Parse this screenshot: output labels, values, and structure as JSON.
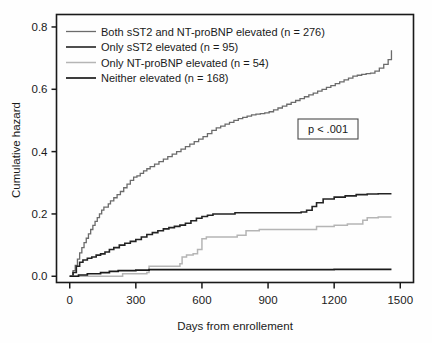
{
  "chart_data": {
    "type": "line",
    "title": "",
    "xlabel": "Days from enrollement",
    "ylabel": "Cumulative hazard",
    "xlim": [
      -60,
      1560
    ],
    "ylim": [
      -0.02,
      0.84
    ],
    "xticks": [
      0,
      300,
      600,
      900,
      1200,
      1500
    ],
    "xtick_labels": [
      "0",
      "300",
      "600",
      "900",
      "1200",
      "1500"
    ],
    "yticks": [
      0.0,
      0.2,
      0.4,
      0.6,
      0.8
    ],
    "ytick_labels": [
      "0.0",
      "0.2",
      "0.4",
      "0.6",
      "0.8"
    ],
    "grid": false,
    "legend_position": "upper-left",
    "annotations": [
      {
        "name": "p-value-box",
        "text": "p < .001",
        "x": 1060,
        "y": 0.44
      }
    ],
    "series": [
      {
        "name": "Both sST2 and NT-proBNP elevated (n = 276)",
        "n": 276,
        "color": "#6b6b6b",
        "width": 1.3,
        "x": [
          0,
          15,
          25,
          35,
          45,
          55,
          65,
          75,
          85,
          95,
          105,
          115,
          125,
          135,
          145,
          155,
          165,
          175,
          185,
          200,
          215,
          230,
          245,
          260,
          275,
          290,
          305,
          320,
          335,
          350,
          365,
          385,
          405,
          425,
          445,
          465,
          485,
          505,
          525,
          545,
          565,
          585,
          605,
          625,
          645,
          665,
          685,
          705,
          725,
          745,
          765,
          785,
          805,
          825,
          845,
          865,
          885,
          905,
          925,
          945,
          965,
          985,
          1005,
          1025,
          1045,
          1065,
          1085,
          1105,
          1125,
          1145,
          1165,
          1185,
          1205,
          1225,
          1245,
          1265,
          1285,
          1305,
          1325,
          1345,
          1365,
          1385,
          1405,
          1425,
          1445,
          1460
        ],
        "y": [
          0.0,
          0.018,
          0.035,
          0.055,
          0.075,
          0.092,
          0.108,
          0.122,
          0.136,
          0.15,
          0.163,
          0.176,
          0.188,
          0.2,
          0.212,
          0.222,
          0.222,
          0.232,
          0.242,
          0.252,
          0.262,
          0.272,
          0.284,
          0.296,
          0.308,
          0.318,
          0.322,
          0.33,
          0.338,
          0.345,
          0.352,
          0.36,
          0.368,
          0.376,
          0.384,
          0.392,
          0.4,
          0.408,
          0.416,
          0.424,
          0.432,
          0.44,
          0.448,
          0.458,
          0.468,
          0.476,
          0.482,
          0.488,
          0.494,
          0.5,
          0.506,
          0.51,
          0.514,
          0.518,
          0.52,
          0.522,
          0.524,
          0.528,
          0.534,
          0.54,
          0.546,
          0.552,
          0.558,
          0.564,
          0.57,
          0.576,
          0.582,
          0.588,
          0.594,
          0.6,
          0.606,
          0.612,
          0.618,
          0.624,
          0.63,
          0.636,
          0.642,
          0.645,
          0.648,
          0.65,
          0.652,
          0.658,
          0.668,
          0.68,
          0.695,
          0.725
        ]
      },
      {
        "name": "Only sST2 elevated (n = 95)",
        "n": 95,
        "color": "#232323",
        "width": 1.6,
        "x": [
          0,
          15,
          30,
          45,
          60,
          80,
          100,
          120,
          140,
          160,
          180,
          200,
          225,
          250,
          275,
          300,
          325,
          350,
          375,
          400,
          425,
          450,
          475,
          500,
          525,
          550,
          575,
          600,
          625,
          650,
          700,
          750,
          800,
          850,
          900,
          950,
          1000,
          1050,
          1075,
          1100,
          1120,
          1150,
          1200,
          1250,
          1300,
          1350,
          1400,
          1450,
          1460
        ],
        "y": [
          0.0,
          0.012,
          0.032,
          0.045,
          0.052,
          0.058,
          0.062,
          0.068,
          0.072,
          0.078,
          0.086,
          0.092,
          0.1,
          0.106,
          0.112,
          0.118,
          0.126,
          0.134,
          0.14,
          0.146,
          0.152,
          0.156,
          0.16,
          0.164,
          0.17,
          0.178,
          0.186,
          0.192,
          0.196,
          0.2,
          0.2,
          0.204,
          0.204,
          0.204,
          0.204,
          0.204,
          0.204,
          0.206,
          0.212,
          0.224,
          0.236,
          0.248,
          0.254,
          0.258,
          0.262,
          0.264,
          0.265,
          0.265,
          0.265
        ]
      },
      {
        "name": "Only NT-proBNP elevated (n = 54)",
        "n": 54,
        "color": "#b5b5b5",
        "width": 1.5,
        "x": [
          0,
          100,
          200,
          240,
          300,
          350,
          360,
          380,
          480,
          500,
          510,
          530,
          560,
          580,
          600,
          620,
          700,
          760,
          800,
          860,
          900,
          1000,
          1080,
          1120,
          1200,
          1260,
          1300,
          1330,
          1350,
          1400,
          1450,
          1460
        ],
        "y": [
          0.0,
          0.0,
          0.0,
          0.008,
          0.008,
          0.012,
          0.032,
          0.032,
          0.032,
          0.04,
          0.062,
          0.068,
          0.072,
          0.086,
          0.12,
          0.126,
          0.126,
          0.132,
          0.146,
          0.15,
          0.15,
          0.15,
          0.15,
          0.16,
          0.164,
          0.168,
          0.168,
          0.18,
          0.188,
          0.19,
          0.19,
          0.19
        ]
      },
      {
        "name": "Neither elevated (n = 168)",
        "n": 168,
        "color": "#1a1a1a",
        "width": 1.7,
        "x": [
          0,
          40,
          80,
          140,
          180,
          220,
          260,
          300,
          340,
          360,
          420,
          500,
          600,
          700,
          800,
          900,
          1000,
          1100,
          1200,
          1300,
          1400,
          1450,
          1460
        ],
        "y": [
          0.0,
          0.004,
          0.008,
          0.012,
          0.016,
          0.018,
          0.018,
          0.02,
          0.02,
          0.021,
          0.021,
          0.021,
          0.021,
          0.021,
          0.021,
          0.021,
          0.021,
          0.021,
          0.022,
          0.022,
          0.022,
          0.022,
          0.022
        ]
      }
    ]
  },
  "legend": {
    "items": [
      {
        "label": "Both sST2 and NT-proBNP elevated (n = 276)",
        "color": "#6b6b6b"
      },
      {
        "label": "Only sST2 elevated (n = 95)",
        "color": "#232323"
      },
      {
        "label": "Only NT-proBNP elevated (n = 54)",
        "color": "#b5b5b5"
      },
      {
        "label": "Neither elevated (n = 168)",
        "color": "#1a1a1a"
      }
    ]
  },
  "axes": {
    "x_title": "Days from enrollement",
    "y_title": "Cumulative hazard",
    "x_tick_labels": [
      "0",
      "300",
      "600",
      "900",
      "1200",
      "1500"
    ],
    "y_tick_labels": [
      "0.0",
      "0.2",
      "0.4",
      "0.6",
      "0.8"
    ]
  },
  "pvalue": {
    "text": "p < .001"
  },
  "style": {
    "frame_color": "#1a1a1a",
    "background": "#fefefe"
  }
}
